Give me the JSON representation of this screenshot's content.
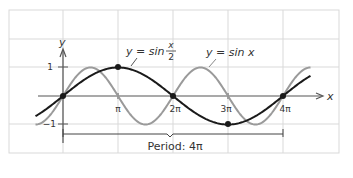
{
  "chart_data": {
    "type": "line",
    "title": "",
    "xlabel": "x",
    "ylabel": "y",
    "xlim": [
      -1.0,
      4.9
    ],
    "ylim": [
      -1.5,
      1.5
    ],
    "grid": true,
    "x_tick_labels": [
      "π",
      "2π",
      "3π",
      "4π"
    ],
    "x_tick_values_in_pi": [
      1,
      2,
      3,
      4
    ],
    "y_tick_labels": [
      "1",
      "−1"
    ],
    "y_tick_values": [
      1,
      -1
    ],
    "series": [
      {
        "name": "y = sin x",
        "label_parts": {
          "prefix": "y = sin x"
        },
        "color": "#9a9a9a",
        "function": "sin(x)",
        "x_range_in_pi": [
          -0.5,
          4.5
        ]
      },
      {
        "name": "y = sin (x/2)",
        "label_parts": {
          "prefix": "y = sin",
          "numerator": "x",
          "denominator": "2"
        },
        "color": "#1a1a1a",
        "function": "sin(x/2)",
        "x_range_in_pi": [
          -0.5,
          4.5
        ],
        "marked_points": [
          {
            "x_pi": 0,
            "y": 0
          },
          {
            "x_pi": 1,
            "y": 1
          },
          {
            "x_pi": 2,
            "y": 0
          },
          {
            "x_pi": 3,
            "y": -1
          },
          {
            "x_pi": 4,
            "y": 0
          }
        ]
      }
    ],
    "annotations": [
      {
        "text": "Period: 4π",
        "type": "bracket",
        "from_pi": 0,
        "to_pi": 4
      }
    ]
  },
  "labels": {
    "x_axis": "x",
    "y_axis": "y",
    "y_one": "1",
    "y_neg_one": "−1",
    "tick_pi": "π",
    "tick_2pi": "2π",
    "tick_3pi": "3π",
    "tick_4pi": "4π",
    "sin_x_label": "y = sin x",
    "sin_half_prefix": "y = sin",
    "sin_half_num": "x",
    "sin_half_den": "2",
    "period_label": "Period: 4π"
  },
  "colors": {
    "grid": "#d9d9d9",
    "axis": "#555555",
    "sin_x": "#9a9a9a",
    "sin_half": "#1a1a1a"
  }
}
